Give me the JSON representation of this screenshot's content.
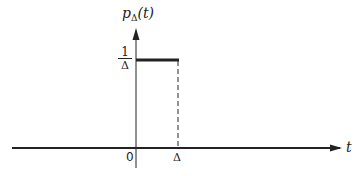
{
  "figure": {
    "y_label": {
      "func": "p",
      "subscript": "Δ",
      "arg": "(t)"
    },
    "x_label": "t",
    "level_label": {
      "numerator": "1",
      "denominator": "Δ"
    },
    "tick_origin": "0",
    "tick_delta": "Δ",
    "colors": {
      "stroke": "#222222",
      "background": "#ffffff"
    }
  }
}
